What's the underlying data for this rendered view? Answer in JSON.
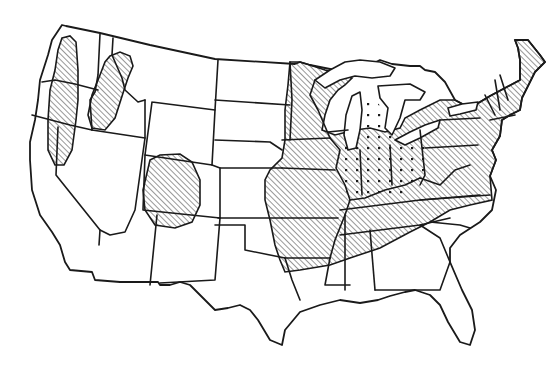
{
  "map": {
    "subject": "Contiguous United States outline map with state boundaries",
    "canvas": {
      "width": 550,
      "height": 373,
      "background": "#ffffff",
      "ink": "#1a1a1a"
    },
    "legend": null,
    "labels": [],
    "patterns": [
      {
        "id": "hatch",
        "kind": "diagonal-lines",
        "color": "#1a1a1a"
      },
      {
        "id": "dots",
        "kind": "dot-stipple",
        "color": "#1a1a1a"
      }
    ],
    "regions": [
      {
        "name": "pacific-northwest-cascades-band",
        "pattern": "hatch",
        "area": "western Washington, Oregon and northeastern California"
      },
      {
        "name": "idaho-panhandle-band",
        "pattern": "hatch",
        "area": "northern Idaho into northeastern Oregon"
      },
      {
        "name": "colorado-plateau-oval",
        "pattern": "hatch",
        "area": "western Colorado and eastern Utah, Four Corners"
      },
      {
        "name": "midwest-and-east",
        "pattern": "hatch",
        "area": "Minnesota, Iowa, Missouri, Wisconsin, Illinois, Arkansas, Tennessee, northern Mississippi/Alabama, Kentucky, Virginia, Pennsylvania, New York, New England, mid-Atlantic"
      },
      {
        "name": "great-lakes-core",
        "pattern": "dots",
        "area": "Lower Michigan, Indiana, Ohio, eastern Illinois, West Virginia"
      }
    ]
  }
}
